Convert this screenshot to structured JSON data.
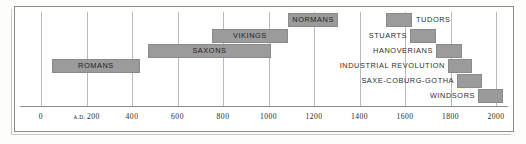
{
  "chart_data": {
    "type": "bar",
    "orientation": "horizontal",
    "title": "",
    "subtitle": "",
    "xlabel": "",
    "ylabel": "",
    "xlim": [
      -60,
      2120
    ],
    "grid": true,
    "legend": false,
    "axis_ticks": [
      {
        "value": 0,
        "label": "0",
        "prefix": ""
      },
      {
        "value": 200,
        "label": "200",
        "prefix": "A.D. "
      },
      {
        "value": 400,
        "label": "400",
        "prefix": ""
      },
      {
        "value": 600,
        "label": "600",
        "prefix": ""
      },
      {
        "value": 800,
        "label": "800",
        "prefix": ""
      },
      {
        "value": 1000,
        "label": "1000",
        "prefix": ""
      },
      {
        "value": 1200,
        "label": "1200",
        "prefix": ""
      },
      {
        "value": 1400,
        "label": "1400",
        "prefix": ""
      },
      {
        "value": 1600,
        "label": "1600",
        "prefix": ""
      },
      {
        "value": 1800,
        "label": "1800",
        "prefix": ""
      },
      {
        "value": 2000,
        "label": "2000",
        "prefix": ""
      }
    ],
    "bar_color": "#9b9b9b",
    "bars": [
      {
        "name": "NORMANS",
        "start": 1086,
        "end": 1306,
        "row": 0,
        "label_pos": "inside"
      },
      {
        "name": "TUDORS",
        "start": 1516,
        "end": 1631,
        "row": 0,
        "label_pos": "right"
      },
      {
        "name": "VIKINGS",
        "start": 751,
        "end": 1086,
        "row": 1,
        "label_pos": "inside"
      },
      {
        "name": "STUARTS",
        "start": 1622,
        "end": 1736,
        "row": 1,
        "label_pos": "left"
      },
      {
        "name": "SAXONS",
        "start": 470,
        "end": 1011,
        "row": 2,
        "label_pos": "inside"
      },
      {
        "name": "HANOVERIANS",
        "start": 1736,
        "end": 1851,
        "row": 2,
        "label_pos": "left"
      },
      {
        "name": "ROMANS",
        "start": 48,
        "end": 435,
        "row": 3,
        "label_pos": "inside"
      },
      {
        "name": "INDUSTRIAL REVOLUTION",
        "start": 1789,
        "end": 1894,
        "row": 3,
        "label_pos": "left"
      },
      {
        "name": "SAXE-COBURG-GOTHA",
        "start": 1829,
        "end": 1938,
        "row": 4,
        "label_pos": "left"
      },
      {
        "name": "WINDSORS",
        "start": 1921,
        "end": 2031,
        "row": 5,
        "label_pos": "left"
      }
    ]
  }
}
